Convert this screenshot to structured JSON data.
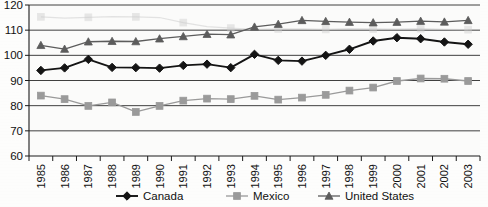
{
  "chart_data": {
    "type": "line",
    "title": "",
    "subtitle": "",
    "xlabel": "",
    "ylabel": "",
    "x": [
      1985,
      1986,
      1987,
      1988,
      1989,
      1990,
      1991,
      1992,
      1993,
      1994,
      1995,
      1996,
      1997,
      1998,
      1999,
      2000,
      2001,
      2002,
      2003
    ],
    "categories": [
      "1985",
      "1986",
      "1987",
      "1988",
      "1989",
      "1990",
      "1991",
      "1992",
      "1993",
      "1994",
      "1995",
      "1996",
      "1997",
      "1998",
      "1999",
      "2000",
      "2001",
      "2002",
      "2003"
    ],
    "ylim": [
      60,
      120
    ],
    "yticks": [
      60,
      70,
      80,
      90,
      100,
      110,
      120
    ],
    "ytick_labels": [
      "60",
      "70",
      "80",
      "90",
      "100",
      "110",
      "120"
    ],
    "grid": true,
    "grid_axis": "y",
    "legend_position": "bottom",
    "series": [
      {
        "name": "Canada",
        "marker": "diamond",
        "color": "#141414",
        "values": [
          94.0,
          95.0,
          98.4,
          95.2,
          95.1,
          94.9,
          96.0,
          96.5,
          95.1,
          100.4,
          98.0,
          97.7,
          100.0,
          102.4,
          105.7,
          107.0,
          106.6,
          105.3,
          104.4
        ]
      },
      {
        "name": "Mexico",
        "marker": "square",
        "color": "#9a9a9a",
        "values": [
          84.0,
          82.6,
          79.9,
          81.3,
          77.5,
          79.9,
          82.0,
          82.8,
          82.6,
          83.9,
          82.4,
          83.2,
          84.3,
          86.0,
          87.2,
          89.8,
          90.8,
          90.7,
          89.8
        ]
      },
      {
        "name": "United States",
        "marker": "triangle",
        "color": "#5c5c5c",
        "values": [
          104.0,
          102.5,
          105.4,
          105.6,
          105.5,
          106.6,
          107.5,
          108.4,
          108.2,
          111.3,
          112.4,
          113.9,
          113.5,
          113.2,
          113.0,
          113.2,
          113.6,
          113.3,
          113.9
        ]
      }
    ],
    "ghost_series": {
      "name": "faint-background-line",
      "color": "#cdcdcd",
      "values": [
        115.3,
        114.8,
        115.1,
        115.4,
        115.3,
        115.0,
        113.0,
        111.4,
        110.8,
        110.3,
        110.5,
        110.5,
        110.3,
        110.6,
        110.5,
        110.4,
        110.6,
        110.3,
        110.2
      ]
    }
  },
  "legend": {
    "items": [
      {
        "label": "Canada",
        "marker": "diamond",
        "color": "#141414"
      },
      {
        "label": "Mexico",
        "marker": "square",
        "color": "#9a9a9a"
      },
      {
        "label": "United States",
        "marker": "triangle",
        "color": "#5c5c5c"
      }
    ]
  },
  "background_text": {
    "line1": "",
    "line2": "",
    "line3": ""
  }
}
